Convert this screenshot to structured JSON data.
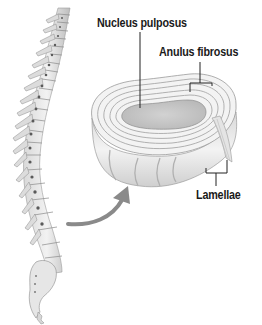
{
  "diagram": {
    "labels": {
      "nucleus": "Nucleus pulposus",
      "anulus": "Anulus fibrosus",
      "lamellae": "Lamellae"
    },
    "colors": {
      "background": "#ffffff",
      "text": "#1a1a1a",
      "leader_line": "#222222",
      "arrow": "#8a8a8a",
      "bone_light": "#ececec",
      "bone_mid": "#c8c8c8",
      "bone_dark": "#7a7a7a",
      "nucleus_fill": "#c9c9c9",
      "disc_ring": "#f4f4f4",
      "disc_line": "#a0a0a0"
    },
    "elements": [
      {
        "name": "spine",
        "description": "Lateral view of vertebral column with sacrum and coccyx"
      },
      {
        "name": "intervertebral-disc",
        "description": "Enlarged 3D view of disc with concentric lamellae and central nucleus"
      },
      {
        "name": "pointer-arrow",
        "description": "Curved gray arrow from lumbar spine to enlarged disc"
      }
    ]
  }
}
